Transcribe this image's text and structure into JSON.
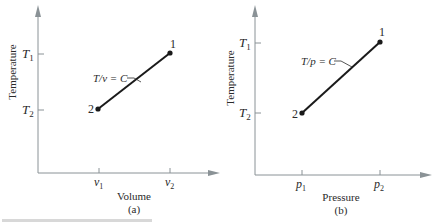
{
  "panels": [
    {
      "id": "a",
      "caption": "(a)",
      "xlabel": "Volume",
      "ylabel": "Temperature",
      "y_ticks": [
        {
          "sym": "T",
          "sub": "1"
        },
        {
          "sym": "T",
          "sub": "2"
        }
      ],
      "x_ticks": [
        {
          "sym": "v",
          "sub": "1"
        },
        {
          "sym": "v",
          "sub": "2"
        }
      ],
      "relation": "T/v = C",
      "points": [
        {
          "label": "1",
          "x": "v2",
          "y": "T1"
        },
        {
          "label": "2",
          "x": "v1",
          "y": "T2"
        }
      ]
    },
    {
      "id": "b",
      "caption": "(b)",
      "xlabel": "Pressure",
      "ylabel": "Temperature",
      "y_ticks": [
        {
          "sym": "T",
          "sub": "1"
        },
        {
          "sym": "T",
          "sub": "2"
        }
      ],
      "x_ticks": [
        {
          "sym": "p",
          "sub": "1"
        },
        {
          "sym": "p",
          "sub": "2"
        }
      ],
      "relation": "T/p = C",
      "points": [
        {
          "label": "1",
          "x": "p2",
          "y": "T1"
        },
        {
          "label": "2",
          "x": "p1",
          "y": "T2"
        }
      ]
    }
  ],
  "colors": {
    "axis": "#8a9296",
    "line": "#1a1a1a",
    "text": "#2a2a2a"
  }
}
